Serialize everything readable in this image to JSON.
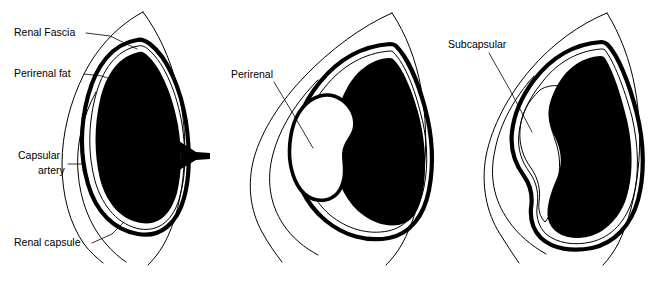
{
  "figure": {
    "background_color": "#ffffff",
    "ink_color": "#000000",
    "width": 653,
    "height": 282,
    "panel_count": 3
  },
  "panels": [
    {
      "id": "panel-normal",
      "name": "normal-anatomy",
      "labels": [
        {
          "id": "renal-fascia",
          "text": "Renal Fascia",
          "x": 14,
          "y": 36
        },
        {
          "id": "perirenal-fat",
          "text": "Perirenal fat",
          "x": 14,
          "y": 77
        },
        {
          "id": "capsular-artery-line1",
          "text": "Capsular",
          "x": 18,
          "y": 159
        },
        {
          "id": "capsular-artery-line2",
          "text": "artery",
          "x": 38,
          "y": 174
        },
        {
          "id": "renal-capsule",
          "text": "Renal capsule",
          "x": 14,
          "y": 246
        }
      ]
    },
    {
      "id": "panel-perirenal",
      "name": "perirenal-hematoma",
      "labels": [
        {
          "id": "perirenal",
          "text": "Perirenal",
          "x": 231,
          "y": 78
        }
      ]
    },
    {
      "id": "panel-subcapsular",
      "name": "subcapsular-hematoma",
      "labels": [
        {
          "id": "subcapsular",
          "text": "Subcapsular",
          "x": 448,
          "y": 48
        }
      ]
    }
  ],
  "structures": {
    "renal_fascia": "thin outer line (Gerota fascia) with pointed apex superiorly and two diverging tails inferiorly",
    "perirenal_fat": "clear space between renal fascia and renal capsule",
    "renal_capsule": "thick black ring immediately around the kidney",
    "capsular_artery": "short black wedge at the hilum",
    "renal_parenchyma": "solid black kidney silhouette",
    "perirenal_collection": "white lobulated collection outside the capsule, within perirenal fat",
    "subcapsular_collection": "white lens-shaped collection beneath the renal capsule, flattening the parenchyma"
  }
}
